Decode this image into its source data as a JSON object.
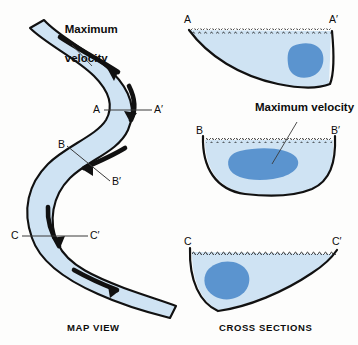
{
  "figure": {
    "background_color": "#fdfdfc",
    "water_fill": "#cfe3f3",
    "velocity_core_fill": "#5b94cf",
    "outline_color": "#111111",
    "arrow_color": "#111111",
    "leader_color": "#3a3a3a"
  },
  "map_view": {
    "caption": "MAP VIEW",
    "max_velocity_label": {
      "line1": "Maximum",
      "line2": "velocity"
    },
    "section_lines": [
      {
        "left_label": "A",
        "right_label": "A′"
      },
      {
        "left_label": "B",
        "right_label": "B′"
      },
      {
        "left_label": "C",
        "right_label": "C′"
      }
    ],
    "flow_arrow_count": 5
  },
  "cross_sections": {
    "caption": "CROSS SECTIONS",
    "max_velocity_label": "Maximum velocity",
    "sections": [
      {
        "name": "section-a",
        "left_label": "A",
        "right_label": "A′",
        "shape": "asymmetric-deep-right",
        "velocity_core_position": "right"
      },
      {
        "name": "section-b",
        "left_label": "B",
        "right_label": "B′",
        "shape": "symmetric-u",
        "velocity_core_position": "center"
      },
      {
        "name": "section-c",
        "left_label": "C",
        "right_label": "C′",
        "shape": "asymmetric-deep-left",
        "velocity_core_position": "left"
      }
    ]
  }
}
